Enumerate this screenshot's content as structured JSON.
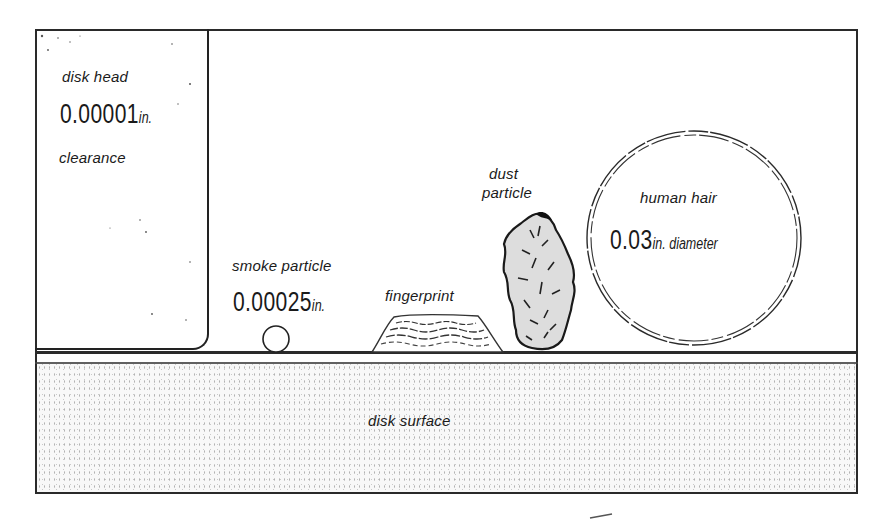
{
  "diagram": {
    "disk_head": {
      "label": "disk head",
      "value": "0.00001",
      "unit": "in.",
      "caption": "clearance"
    },
    "smoke_particle": {
      "label": "smoke particle",
      "value": "0.00025",
      "unit": "in."
    },
    "fingerprint": {
      "label": "fingerprint"
    },
    "dust_particle": {
      "label_line1": "dust",
      "label_line2": "particle"
    },
    "human_hair": {
      "label": "human hair",
      "value": "0.03",
      "unit": "in. diameter"
    },
    "disk_surface": {
      "label": "disk surface"
    },
    "colors": {
      "ink": "#1a1a1a",
      "paper": "#ffffff",
      "surface_stipple": "#9a9a9a"
    }
  }
}
